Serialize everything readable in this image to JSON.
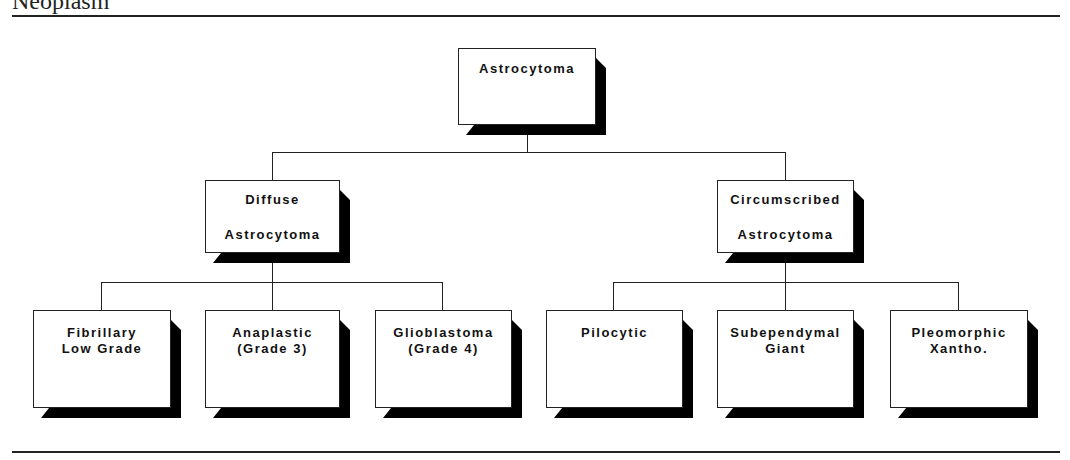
{
  "page": {
    "title": "Neoplasm"
  },
  "diagram": {
    "type": "hierarchy",
    "root": {
      "lines": [
        "Astrocytoma"
      ]
    },
    "level1": [
      {
        "lines": [
          "Diffuse",
          "Astrocytoma"
        ]
      },
      {
        "lines": [
          "Circumscribed",
          "Astrocytoma"
        ]
      }
    ],
    "level2": [
      {
        "parent": 0,
        "lines": [
          "Fibrillary",
          "Low Grade"
        ]
      },
      {
        "parent": 0,
        "lines": [
          "Anaplastic",
          "(Grade 3)"
        ]
      },
      {
        "parent": 0,
        "lines": [
          "Glioblastoma",
          "(Grade 4)"
        ]
      },
      {
        "parent": 1,
        "lines": [
          "Pilocytic"
        ]
      },
      {
        "parent": 1,
        "lines": [
          "Subependymal",
          "Giant"
        ]
      },
      {
        "parent": 1,
        "lines": [
          "Pleomorphic",
          "Xantho."
        ]
      }
    ],
    "colors": {
      "line": "#222222",
      "shadow": "#000000",
      "box": "#ffffff"
    }
  }
}
